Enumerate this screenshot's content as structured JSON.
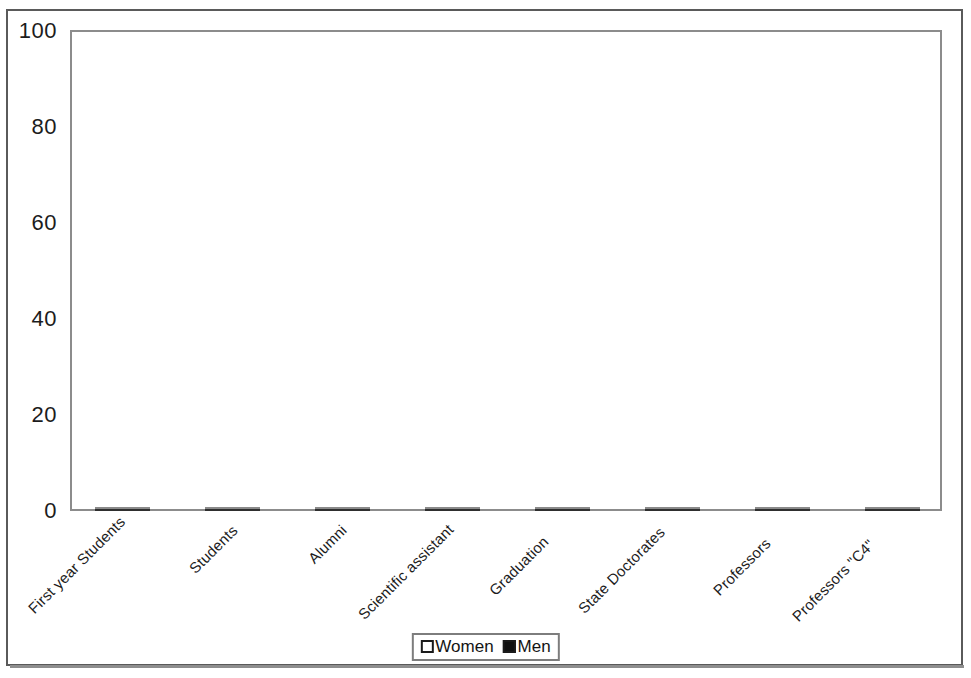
{
  "chart_data": {
    "type": "bar",
    "subtype": "stacked-100-percent",
    "title": "",
    "xlabel": "",
    "ylabel": "",
    "ylim": [
      0,
      100
    ],
    "yticks": [
      "0",
      "20",
      "40",
      "60",
      "80",
      "100"
    ],
    "grid": false,
    "legend_position": "bottom-center",
    "categories": [
      "First year Students",
      "Students",
      "Alumni",
      "Scientific assistant",
      "Graduation",
      "State Doctorates",
      "Professors",
      "Professors \"C4\""
    ],
    "series": [
      {
        "name": "Women",
        "color": "#c2c2c2",
        "values": [
          48,
          47.5,
          49,
          31,
          38.5,
          22,
          13,
          9.5
        ]
      },
      {
        "name": "Men",
        "color": "#474747",
        "values": [
          52,
          52.5,
          51,
          69,
          61.5,
          78,
          87,
          90.5
        ]
      }
    ]
  },
  "legend": {
    "items": [
      {
        "label": "Women",
        "swatch": "white-square"
      },
      {
        "label": "Men",
        "swatch": "black-square"
      }
    ]
  }
}
